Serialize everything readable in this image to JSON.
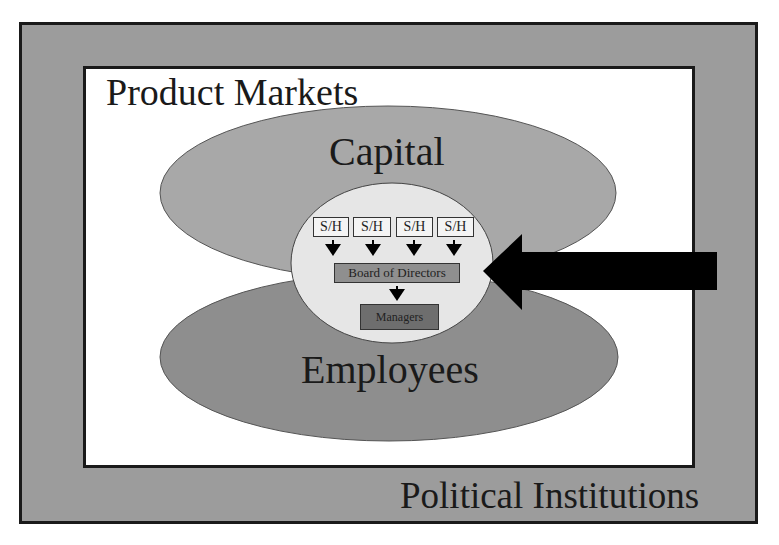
{
  "diagram": {
    "outer_frame": {
      "label": "Political Institutions",
      "fill": "#9c9c9c"
    },
    "inner_box": {
      "label": "Product Markets",
      "fill": "#ffffff"
    },
    "ellipses": {
      "capital": {
        "label": "Capital",
        "fill": "#a8a8a8"
      },
      "employees": {
        "label": "Employees",
        "fill": "#8e8e8e"
      },
      "firm": {
        "fill": "#e6e6e6"
      }
    },
    "firm": {
      "shareholders": [
        "S/H",
        "S/H",
        "S/H",
        "S/H"
      ],
      "board": "Board of Directors",
      "managers": "Managers"
    },
    "external_arrow": {
      "direction": "left",
      "color": "#000000"
    }
  }
}
